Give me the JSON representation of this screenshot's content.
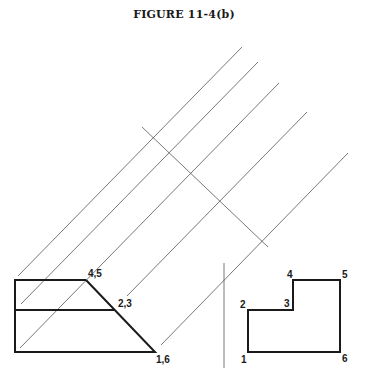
{
  "figure": {
    "title": "FIGURE 11-4(b)"
  },
  "front_view": {
    "labels": {
      "top_right": "4,5",
      "middle_right": "2,3",
      "bottom_right": "1,6"
    }
  },
  "side_view": {
    "labels": {
      "p1": "1",
      "p2": "2",
      "p3": "3",
      "p4": "4",
      "p5": "5",
      "p6": "6"
    }
  },
  "colors": {
    "stroke": "#1a1a1a",
    "construction": "#555555",
    "background": "#ffffff"
  }
}
